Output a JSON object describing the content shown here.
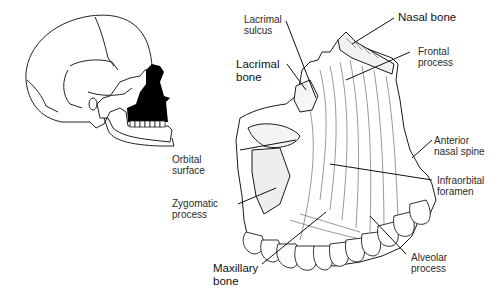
{
  "diagram": {
    "colors": {
      "ink": "#1a1a1a",
      "background": "#ffffff",
      "highlight": "#000000"
    },
    "locator": {
      "name": "skull-lateral-view",
      "highlighted_region": "maxilla"
    },
    "labels": [
      {
        "id": "lacrimal-sulcus",
        "text": "Lacrimal\nsulcus",
        "bold": false
      },
      {
        "id": "nasal-bone",
        "text": "Nasal bone",
        "bold": true
      },
      {
        "id": "frontal-process",
        "text": "Frontal\nprocess",
        "bold": false
      },
      {
        "id": "lacrimal-bone",
        "text": "Lacrimal\nbone",
        "bold": true
      },
      {
        "id": "anterior-nasal-spine",
        "text": "Anterior\nnasal spine",
        "bold": false
      },
      {
        "id": "orbital-surface",
        "text": "Orbital\nsurface",
        "bold": false
      },
      {
        "id": "infraorbital-foramen",
        "text": "Infraorbital\nforamen",
        "bold": false
      },
      {
        "id": "zygomatic-process",
        "text": "Zygomatic\nprocess",
        "bold": false
      },
      {
        "id": "maxillary-bone",
        "text": "Maxillary\nbone",
        "bold": true
      },
      {
        "id": "alveolar-process",
        "text": "Alveolar\nprocess",
        "bold": false
      }
    ]
  }
}
